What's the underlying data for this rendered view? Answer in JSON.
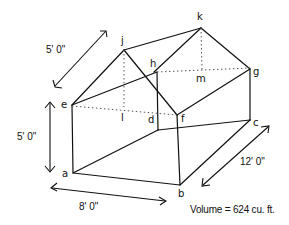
{
  "diagram": {
    "vertices": {
      "a": "a",
      "b": "b",
      "c": "c",
      "d": "d",
      "e": "e",
      "f": "f",
      "g": "g",
      "h": "h",
      "j": "j",
      "k": "k",
      "l": "l",
      "m": "m"
    },
    "dimensions": {
      "roof_slope": "5' 0\"",
      "wall_height": "5' 0\"",
      "width": "8' 0\"",
      "length": "12' 0\""
    },
    "volume_label": "Volume = 624 cu. ft."
  }
}
